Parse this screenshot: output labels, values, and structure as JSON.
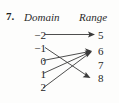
{
  "exercise": {
    "number_label": "7.",
    "headings": {
      "domain": "Domain",
      "range": "Range"
    }
  },
  "diagram": {
    "type": "mapping-diagram",
    "domain_values": [
      "−2",
      "−1",
      "0",
      "1",
      "2"
    ],
    "range_values": [
      "5",
      "6",
      "7",
      "8"
    ],
    "mappings": [
      {
        "from": "−2",
        "to": "5"
      },
      {
        "from": "−1",
        "to": "8"
      },
      {
        "from": "0",
        "to": "6"
      },
      {
        "from": "1",
        "to": "6"
      },
      {
        "from": "2",
        "to": "6"
      }
    ],
    "unmapped_range_values": [
      "7"
    ],
    "ink_color": "#3a3a3a",
    "text_color": "#1f1f1f",
    "background_color": "#fdfdfc"
  }
}
